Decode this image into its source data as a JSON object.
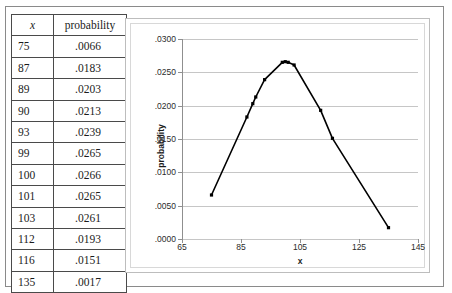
{
  "table": {
    "headers": [
      "x",
      "probability"
    ],
    "rows": [
      {
        "x": "75",
        "probability": ".0066"
      },
      {
        "x": "87",
        "probability": ".0183"
      },
      {
        "x": "89",
        "probability": ".0203"
      },
      {
        "x": "90",
        "probability": ".0213"
      },
      {
        "x": "93",
        "probability": ".0239"
      },
      {
        "x": "99",
        "probability": ".0265"
      },
      {
        "x": "100",
        "probability": ".0266"
      },
      {
        "x": "101",
        "probability": ".0265"
      },
      {
        "x": "103",
        "probability": ".0261"
      },
      {
        "x": "112",
        "probability": ".0193"
      },
      {
        "x": "116",
        "probability": ".0151"
      },
      {
        "x": "135",
        "probability": ".0017"
      }
    ]
  },
  "chart_data": {
    "type": "line",
    "title": "",
    "xlabel": "x",
    "ylabel": "probability",
    "x": [
      75,
      87,
      89,
      90,
      93,
      99,
      100,
      101,
      103,
      112,
      116,
      135
    ],
    "values": [
      0.0066,
      0.0183,
      0.0203,
      0.0213,
      0.0239,
      0.0265,
      0.0266,
      0.0265,
      0.0261,
      0.0193,
      0.0151,
      0.0017
    ],
    "series": [
      {
        "name": "probability",
        "values": [
          0.0066,
          0.0183,
          0.0203,
          0.0213,
          0.0239,
          0.0265,
          0.0266,
          0.0265,
          0.0261,
          0.0193,
          0.0151,
          0.0017
        ]
      }
    ],
    "xlim": [
      65,
      145
    ],
    "ylim": [
      0.0,
      0.03
    ],
    "xticks": [
      65,
      85,
      105,
      125,
      145
    ],
    "xtick_labels": [
      "65",
      "85",
      "105",
      "125",
      "145"
    ],
    "yticks": [
      0.0,
      0.005,
      0.01,
      0.015,
      0.02,
      0.025,
      0.03
    ],
    "ytick_labels": [
      ".0000",
      ".0050",
      ".0100",
      ".0150",
      ".0200",
      ".0250",
      ".0300"
    ],
    "grid": "horizontal",
    "legend": "none",
    "marker": "square",
    "line_color": "#000000",
    "marker_color": "#000000",
    "gridline_color": "#c6c6c6"
  }
}
